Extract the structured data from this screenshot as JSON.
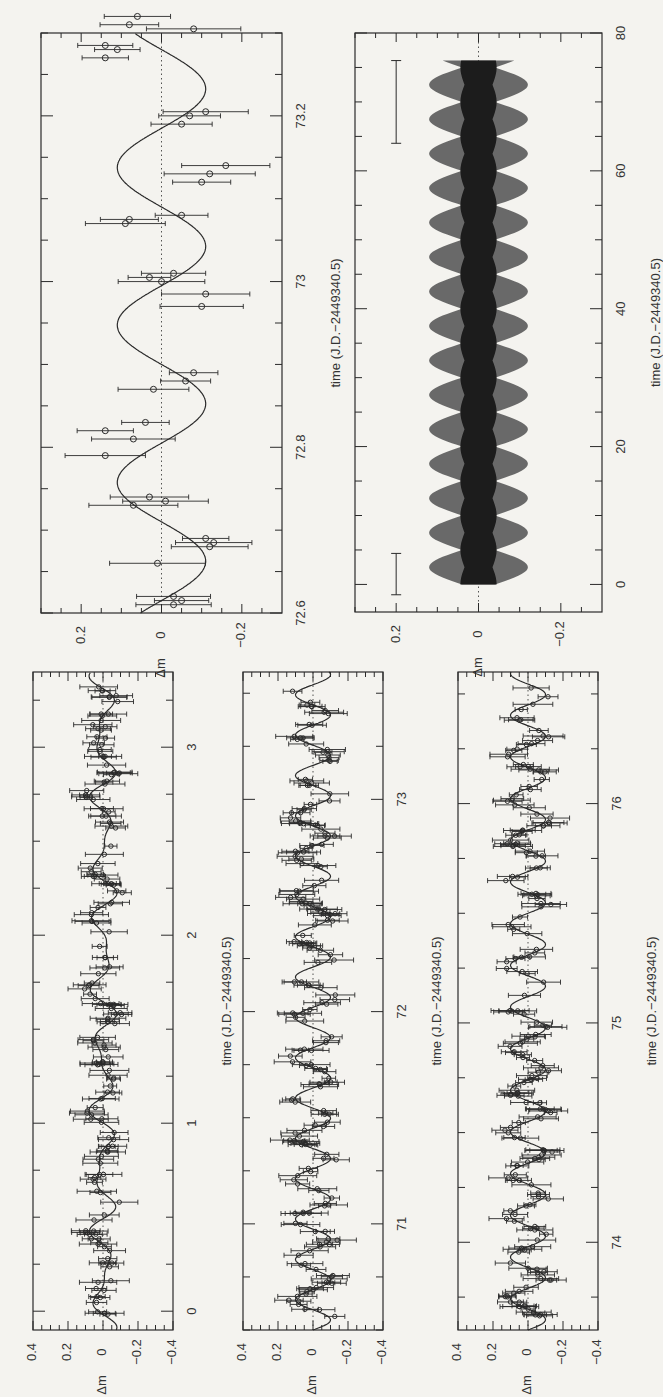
{
  "figure": {
    "orientation": "rotated 90deg counter-clockwise (page-landscape figure)",
    "ink_color": "#2a2a2a",
    "paper_color": "#f4f3ef"
  },
  "chart_data": [
    {
      "id": "panel-detail",
      "type": "scatter",
      "title": "",
      "xlabel": "time (J.D.−2449340.5)",
      "ylabel": "Δm",
      "xlim": [
        72.6,
        73.3
      ],
      "ylim": [
        -0.3,
        0.3
      ],
      "x_ticks": [
        "72.6",
        "72.8",
        "73",
        "73.2"
      ],
      "y_ticks": [
        "0.2",
        "0",
        "-0.2"
      ],
      "reference_line": 0,
      "fit": {
        "type": "sinusoid",
        "amplitude": 0.11,
        "period_days": 0.19,
        "phase_zero_day": 72.615
      },
      "points": [
        {
          "t": 72.61,
          "dm": -0.03
        },
        {
          "t": 72.615,
          "dm": -0.05
        },
        {
          "t": 72.62,
          "dm": -0.03
        },
        {
          "t": 72.66,
          "dm": 0.01
        },
        {
          "t": 72.68,
          "dm": -0.12
        },
        {
          "t": 72.685,
          "dm": -0.13
        },
        {
          "t": 72.69,
          "dm": -0.11
        },
        {
          "t": 72.73,
          "dm": 0.07
        },
        {
          "t": 72.74,
          "dm": 0.03
        },
        {
          "t": 72.735,
          "dm": -0.01
        },
        {
          "t": 72.79,
          "dm": 0.14
        },
        {
          "t": 72.82,
          "dm": 0.14
        },
        {
          "t": 72.81,
          "dm": 0.07
        },
        {
          "t": 72.83,
          "dm": 0.04
        },
        {
          "t": 72.87,
          "dm": 0.02
        },
        {
          "t": 72.88,
          "dm": -0.06
        },
        {
          "t": 72.89,
          "dm": -0.08
        },
        {
          "t": 72.97,
          "dm": -0.1
        },
        {
          "t": 72.985,
          "dm": -0.11
        },
        {
          "t": 73.0,
          "dm": 0.0
        },
        {
          "t": 73.005,
          "dm": 0.03
        },
        {
          "t": 73.01,
          "dm": -0.03
        },
        {
          "t": 73.07,
          "dm": 0.09
        },
        {
          "t": 73.075,
          "dm": 0.08
        },
        {
          "t": 73.08,
          "dm": -0.05
        },
        {
          "t": 73.12,
          "dm": -0.1
        },
        {
          "t": 73.13,
          "dm": -0.12
        },
        {
          "t": 73.14,
          "dm": -0.16
        },
        {
          "t": 73.19,
          "dm": -0.05
        },
        {
          "t": 73.2,
          "dm": -0.07
        },
        {
          "t": 73.205,
          "dm": -0.11
        },
        {
          "t": 73.27,
          "dm": 0.14
        },
        {
          "t": 73.28,
          "dm": 0.11
        },
        {
          "t": 73.285,
          "dm": 0.14
        },
        {
          "t": 73.31,
          "dm": 0.08
        },
        {
          "t": 73.32,
          "dm": 0.06
        },
        {
          "t": 73.305,
          "dm": -0.08
        }
      ]
    },
    {
      "id": "panel-envelope",
      "type": "area",
      "title": "",
      "xlabel": "time (J.D.−2449340.5)",
      "ylabel": "Δm",
      "xlim": [
        -4,
        80
      ],
      "ylim": [
        -0.3,
        0.3
      ],
      "x_ticks": [
        "0",
        "20",
        "40",
        "60",
        "80"
      ],
      "y_ticks": [
        "0.2",
        "0",
        "-0.2"
      ],
      "description": "Simulated light-curve envelope (dense sinusoid, dark band) with beating modulation",
      "envelope": {
        "t_start": 0,
        "t_end": 76,
        "inner_halfwidth": 0.04,
        "outer_halfwidth": 0.12,
        "beat_period_days": 5.0
      },
      "error_bar_samples": [
        {
          "t": 1.5,
          "dm": 0.2,
          "half_range": 0.03
        },
        {
          "t": 70,
          "dm": 0.2,
          "half_range": 0.06
        }
      ]
    },
    {
      "id": "panel-lc-0-3",
      "type": "scatter",
      "xlabel": "time (J.D.−2449340.5)",
      "ylabel": "Δm",
      "xlim": [
        -0.1,
        3.4
      ],
      "ylim": [
        -0.4,
        0.4
      ],
      "x_ticks": [
        "0",
        "1",
        "2",
        "3"
      ],
      "y_ticks": [
        "0.4",
        "0.2",
        "0",
        "-0.2",
        "-0.4"
      ],
      "fit": {
        "type": "multi-sinusoid",
        "amplitude": 0.05
      },
      "n_points_approx": 180
    },
    {
      "id": "panel-lc-71-73",
      "type": "scatter",
      "xlabel": "time (J.D.−2449340.5)",
      "ylabel": "Δm",
      "xlim": [
        70.5,
        73.6
      ],
      "ylim": [
        -0.4,
        0.4
      ],
      "x_ticks": [
        "71",
        "72",
        "73"
      ],
      "y_ticks": [
        "0.4",
        "0.2",
        "0",
        "-0.2",
        "-0.4"
      ],
      "fit": {
        "type": "sinusoid",
        "amplitude": 0.1,
        "period_days": 0.19
      },
      "n_points_approx": 200
    },
    {
      "id": "panel-lc-74-76",
      "type": "scatter",
      "xlabel": "time (J.D.−2449340.5)",
      "ylabel": "Δm",
      "xlim": [
        73.6,
        76.6
      ],
      "ylim": [
        -0.4,
        0.4
      ],
      "x_ticks": [
        "74",
        "75",
        "76"
      ],
      "y_ticks": [
        "0.4",
        "0.2",
        "0",
        "-0.2",
        "-0.4"
      ],
      "fit": {
        "type": "sinusoid",
        "amplitude": 0.1,
        "period_days": 0.19
      },
      "n_points_approx": 200
    }
  ],
  "labels": {
    "dm": "Δm",
    "time": "time (J.D.−2449340.5)"
  }
}
